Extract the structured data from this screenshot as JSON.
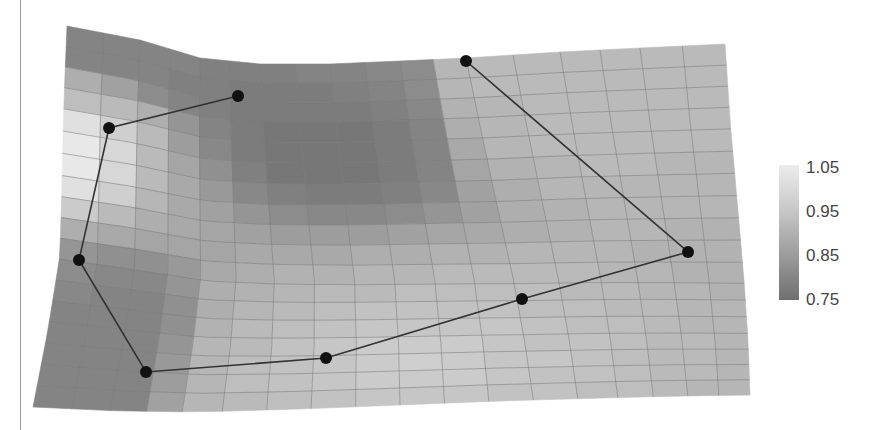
{
  "chart_data": {
    "type": "heatmap",
    "title": "",
    "xlabel": "",
    "ylabel": "",
    "colorbar": {
      "ticks": [
        "1.05",
        "0.95",
        "0.85",
        "0.75"
      ],
      "range": [
        0.75,
        1.05
      ],
      "colors": {
        "low": "#6f6f6f",
        "high": "#ececec"
      }
    },
    "grid": {
      "cols": 18,
      "rows": 18
    },
    "surface_outline": {
      "top": [
        [
          67,
          26
        ],
        [
          140,
          40
        ],
        [
          200,
          58
        ],
        [
          260,
          64
        ],
        [
          330,
          64
        ],
        [
          400,
          61
        ],
        [
          466,
          58
        ],
        [
          560,
          52
        ],
        [
          640,
          48
        ],
        [
          725,
          44
        ]
      ],
      "bottom": [
        [
          33,
          407
        ],
        [
          120,
          411
        ],
        [
          200,
          412
        ],
        [
          300,
          409
        ],
        [
          400,
          405
        ],
        [
          500,
          401
        ],
        [
          600,
          398
        ],
        [
          680,
          396
        ],
        [
          750,
          395
        ]
      ],
      "left": [
        [
          67,
          26
        ],
        [
          64,
          100
        ],
        [
          62,
          180
        ],
        [
          60,
          255
        ],
        [
          48,
          330
        ],
        [
          33,
          407
        ]
      ],
      "right": [
        [
          725,
          44
        ],
        [
          730,
          120
        ],
        [
          737,
          200
        ],
        [
          744,
          280
        ],
        [
          748,
          340
        ],
        [
          750,
          395
        ]
      ]
    },
    "values": [
      [
        0.8,
        0.8,
        0.8,
        0.8,
        0.79,
        0.79,
        0.79,
        0.8,
        0.8,
        0.81,
        0.82,
        0.92,
        0.93,
        0.93,
        0.93,
        0.93,
        0.93,
        0.93
      ],
      [
        0.8,
        0.8,
        0.8,
        0.79,
        0.79,
        0.78,
        0.78,
        0.78,
        0.79,
        0.8,
        0.82,
        0.92,
        0.93,
        0.93,
        0.93,
        0.93,
        0.93,
        0.93
      ],
      [
        0.9,
        0.87,
        0.82,
        0.8,
        0.79,
        0.78,
        0.78,
        0.78,
        0.78,
        0.79,
        0.81,
        0.91,
        0.92,
        0.93,
        0.93,
        0.93,
        0.93,
        0.93
      ],
      [
        0.94,
        0.93,
        0.9,
        0.84,
        0.8,
        0.78,
        0.77,
        0.77,
        0.77,
        0.78,
        0.8,
        0.9,
        0.92,
        0.93,
        0.93,
        0.93,
        0.93,
        0.93
      ],
      [
        1.02,
        0.98,
        0.93,
        0.86,
        0.81,
        0.78,
        0.77,
        0.77,
        0.77,
        0.78,
        0.8,
        0.89,
        0.92,
        0.93,
        0.93,
        0.93,
        0.93,
        0.93
      ],
      [
        1.04,
        1.0,
        0.93,
        0.88,
        0.83,
        0.79,
        0.77,
        0.77,
        0.77,
        0.78,
        0.8,
        0.88,
        0.91,
        0.92,
        0.93,
        0.93,
        0.92,
        0.92
      ],
      [
        1.04,
        1.0,
        0.93,
        0.89,
        0.85,
        0.81,
        0.79,
        0.78,
        0.78,
        0.79,
        0.81,
        0.87,
        0.9,
        0.92,
        0.92,
        0.92,
        0.92,
        0.92
      ],
      [
        1.02,
        0.98,
        0.92,
        0.89,
        0.87,
        0.84,
        0.82,
        0.81,
        0.81,
        0.82,
        0.84,
        0.87,
        0.9,
        0.91,
        0.92,
        0.92,
        0.92,
        0.92
      ],
      [
        0.97,
        0.93,
        0.9,
        0.89,
        0.88,
        0.87,
        0.86,
        0.86,
        0.86,
        0.87,
        0.88,
        0.89,
        0.9,
        0.91,
        0.92,
        0.92,
        0.91,
        0.91
      ],
      [
        0.9,
        0.89,
        0.88,
        0.88,
        0.88,
        0.89,
        0.89,
        0.89,
        0.9,
        0.9,
        0.91,
        0.91,
        0.92,
        0.92,
        0.92,
        0.91,
        0.91,
        0.91
      ],
      [
        0.84,
        0.83,
        0.83,
        0.85,
        0.89,
        0.9,
        0.91,
        0.91,
        0.92,
        0.92,
        0.93,
        0.93,
        0.93,
        0.93,
        0.92,
        0.92,
        0.91,
        0.91
      ],
      [
        0.82,
        0.81,
        0.81,
        0.84,
        0.9,
        0.91,
        0.92,
        0.93,
        0.93,
        0.94,
        0.94,
        0.94,
        0.94,
        0.93,
        0.93,
        0.92,
        0.92,
        0.91
      ],
      [
        0.81,
        0.8,
        0.8,
        0.83,
        0.9,
        0.92,
        0.93,
        0.94,
        0.95,
        0.95,
        0.95,
        0.95,
        0.94,
        0.94,
        0.93,
        0.93,
        0.92,
        0.92
      ],
      [
        0.8,
        0.8,
        0.8,
        0.83,
        0.91,
        0.93,
        0.94,
        0.95,
        0.96,
        0.96,
        0.96,
        0.96,
        0.95,
        0.94,
        0.94,
        0.93,
        0.92,
        0.92
      ],
      [
        0.8,
        0.8,
        0.8,
        0.84,
        0.92,
        0.93,
        0.95,
        0.96,
        0.97,
        0.97,
        0.97,
        0.96,
        0.95,
        0.95,
        0.94,
        0.93,
        0.93,
        0.92
      ],
      [
        0.8,
        0.8,
        0.8,
        0.85,
        0.92,
        0.94,
        0.95,
        0.96,
        0.97,
        0.98,
        0.97,
        0.96,
        0.96,
        0.95,
        0.94,
        0.93,
        0.93,
        0.92
      ],
      [
        0.8,
        0.8,
        0.8,
        0.86,
        0.92,
        0.94,
        0.95,
        0.96,
        0.97,
        0.97,
        0.97,
        0.96,
        0.95,
        0.95,
        0.94,
        0.93,
        0.93,
        0.92
      ],
      [
        0.8,
        0.8,
        0.8,
        0.87,
        0.92,
        0.93,
        0.94,
        0.95,
        0.96,
        0.96,
        0.96,
        0.95,
        0.95,
        0.94,
        0.94,
        0.93,
        0.92,
        0.92
      ]
    ],
    "polygon_points": [
      {
        "x": 466,
        "y": 61
      },
      {
        "x": 688,
        "y": 252
      },
      {
        "x": 522,
        "y": 299
      },
      {
        "x": 326,
        "y": 358
      },
      {
        "x": 146,
        "y": 372
      },
      {
        "x": 79,
        "y": 260
      },
      {
        "x": 109,
        "y": 128
      },
      {
        "x": 238,
        "y": 96
      }
    ],
    "polygon_closed": false,
    "marker_color": "#111111",
    "line_color": "#333333"
  }
}
